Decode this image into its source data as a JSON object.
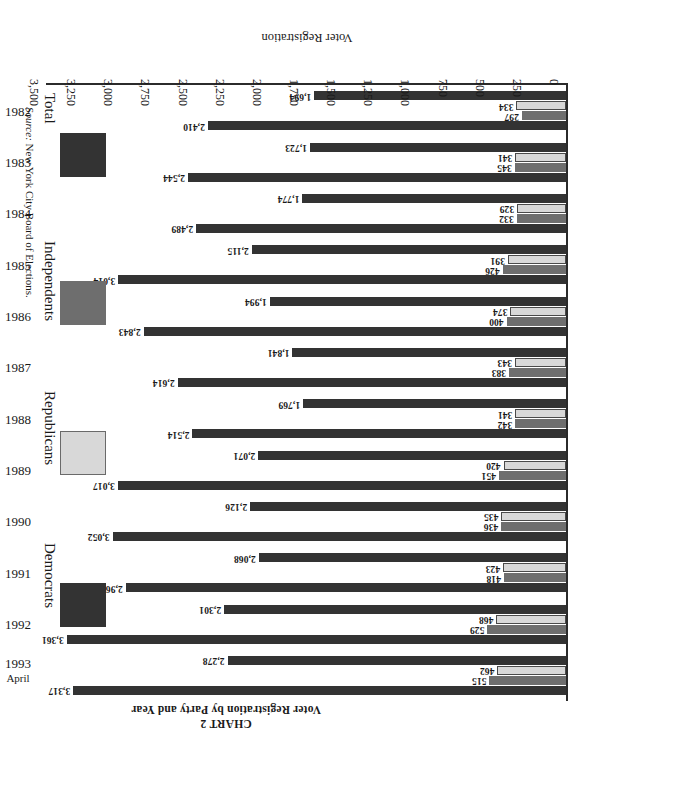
{
  "titles": {
    "chart_label": "CHART 2",
    "chart_title": "Voter Registration by Party and Year"
  },
  "axes": {
    "value_axis_title": "Voter Registration",
    "value_ticks": [
      "0",
      "250",
      "500",
      "750",
      "1,000",
      "1,250",
      "1,500",
      "1,750",
      "2,000",
      "2,250",
      "2,500",
      "2,750",
      "3,000",
      "3,250",
      "3,500"
    ],
    "category_label_extra": "April"
  },
  "legend": {
    "items": [
      {
        "label": "Democrats",
        "color": "#333333"
      },
      {
        "label": "Republicans",
        "color": "#d8d8d8"
      },
      {
        "label": "Independents",
        "color": "#6e6e6e"
      },
      {
        "label": "Total",
        "color": "#333333"
      }
    ]
  },
  "source": {
    "prefix": "Source:",
    "text": "New York City Board of Elections."
  },
  "chart_data": {
    "type": "bar",
    "orientation": "horizontal",
    "title": "Voter Registration by Party and Year",
    "subtitle": "CHART 2",
    "xlabel": "Voter Registration",
    "ylabel": "",
    "xlim": [
      0,
      3500
    ],
    "xtick_step": 250,
    "grid": false,
    "legend_position": "right",
    "units": "thousands",
    "categories": [
      "1982",
      "1983",
      "1984",
      "1985",
      "1986",
      "1987",
      "1988",
      "1989",
      "1990",
      "1991",
      "1992",
      "1993"
    ],
    "category_notes": {
      "1993": "April"
    },
    "series": [
      {
        "name": "Democrats",
        "color": "#333333",
        "values": [
          1694,
          1723,
          1774,
          2115,
          1994,
          1841,
          1769,
          2071,
          2126,
          2068,
          2301,
          2278
        ],
        "labels": [
          "1,694",
          "1,723",
          "1,774",
          "2,115",
          "1,994",
          "1,841",
          "1,769",
          "2,071",
          "2,126",
          "2,068",
          "2,301",
          "2,278"
        ]
      },
      {
        "name": "Republicans",
        "color": "#d8d8d8",
        "values": [
          334,
          341,
          329,
          391,
          374,
          343,
          341,
          420,
          435,
          423,
          468,
          462
        ],
        "labels": [
          "334",
          "341",
          "329",
          "391",
          "374",
          "343",
          "341",
          "420",
          "435",
          "423",
          "468",
          "462"
        ]
      },
      {
        "name": "Independents",
        "color": "#6e6e6e",
        "values": [
          297,
          345,
          332,
          426,
          400,
          383,
          342,
          451,
          436,
          418,
          529,
          515
        ],
        "labels": [
          "297",
          "345",
          "332",
          "426",
          "400",
          "383",
          "342",
          "451",
          "436",
          "418",
          "529",
          "515"
        ]
      },
      {
        "name": "Total",
        "color": "#333333",
        "values": [
          2410,
          2544,
          2489,
          3014,
          2843,
          2614,
          2514,
          3017,
          3052,
          2963,
          3361,
          3317
        ],
        "labels": [
          "2,410",
          "2,544",
          "2,489",
          "3,014",
          "2,843",
          "2,614",
          "2,514",
          "3,017",
          "3,052",
          "2,963",
          "3,361",
          "3,317"
        ]
      }
    ]
  }
}
